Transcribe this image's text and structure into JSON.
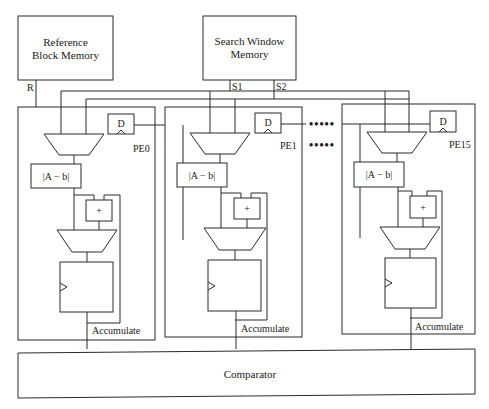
{
  "diagram": {
    "memories": {
      "reference": {
        "line1": "Reference",
        "line2": "Block Memory",
        "port": "R"
      },
      "search": {
        "line1": "Search Window",
        "line2": "Memory",
        "port1": "S1",
        "port2": "S2"
      }
    },
    "pes": [
      {
        "id": "PE0",
        "dff": "D",
        "absdiff": "|A − b|",
        "adder": "+",
        "accumulate": "Accumulate"
      },
      {
        "id": "PE1",
        "dff": "D",
        "absdiff": "|A − b|",
        "adder": "+",
        "accumulate": "Accumulate"
      },
      {
        "id": "PE15",
        "dff": "D",
        "absdiff": "|A − b|",
        "adder": "+",
        "accumulate": "Accumulate"
      }
    ],
    "ellipsis": "•••••",
    "comparator": "Comparator"
  },
  "colors": {
    "line": "#2a2a2a",
    "background": "#ffffff",
    "text": "#1a1a1a"
  }
}
